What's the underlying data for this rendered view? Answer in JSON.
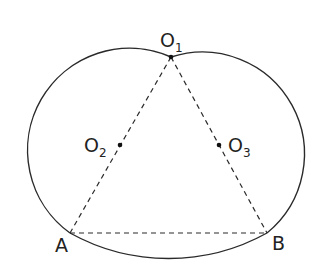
{
  "diagram": {
    "type": "geometric-construction",
    "points": {
      "O1": {
        "label": "O",
        "sub": "1",
        "x": 171,
        "y": 57
      },
      "O2": {
        "label": "O",
        "sub": "2",
        "x": 120,
        "y": 145
      },
      "O3": {
        "label": "O",
        "sub": "3",
        "x": 219,
        "y": 145
      },
      "A": {
        "label": "A",
        "x": 70,
        "y": 233
      },
      "B": {
        "label": "B",
        "x": 267,
        "y": 233
      }
    },
    "arcs": [
      {
        "name": "left-arc",
        "center": "O2",
        "from": "A",
        "to": "O1"
      },
      {
        "name": "right-arc",
        "center": "O3",
        "from": "O1",
        "to": "B"
      },
      {
        "name": "bottom-arc",
        "center": "O1",
        "from": "B",
        "to": "A"
      }
    ],
    "dashed_segments": [
      [
        "O1",
        "A"
      ],
      [
        "O1",
        "B"
      ],
      [
        "A",
        "B"
      ]
    ],
    "colors": {
      "stroke": "#2a2a2a",
      "background": "#ffffff"
    }
  }
}
